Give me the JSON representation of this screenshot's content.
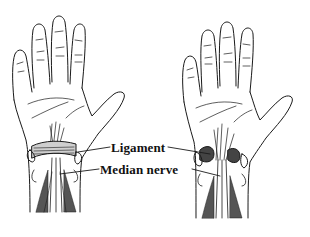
{
  "figure": {
    "hands": [
      {
        "id": "left-hand",
        "state": "ligament intact"
      },
      {
        "id": "right-hand",
        "state": "ligament released"
      }
    ],
    "labels": {
      "ligament": "Ligament",
      "median_nerve": "Median nerve"
    },
    "colors": {
      "background": "#ffffff",
      "ink": "#1a1a1a"
    }
  }
}
